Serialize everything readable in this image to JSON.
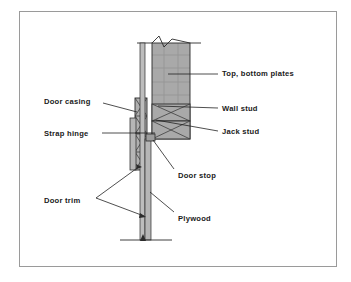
{
  "figure": {
    "border_color": "#9a9a9a",
    "background_color": "#ffffff"
  },
  "palette": {
    "stud_fill": "#a9a9a9",
    "plate_fill": "#a9a9a9",
    "casing_fill": "#b0b0b0",
    "trim_fill": "#b6b6b6",
    "plywood_fill": "#bdbdbd",
    "door_stop_fill": "#9c9c9c",
    "line_color": "#2b2b2b",
    "text_color": "#1a1a1a"
  },
  "labels": {
    "top_bottom_plates": "Top, bottom plates",
    "wall_stud": "Wall stud",
    "jack_stud": "Jack stud",
    "door_casing": "Door casing",
    "strap_hinge": "Strap hinge",
    "door_stop": "Door stop",
    "door_trim": "Door trim",
    "plywood": "Plywood"
  },
  "callouts": [
    {
      "id": "top-bottom-plates",
      "label": "Top, bottom plates",
      "side": "right",
      "text_x": 222,
      "text_y": 76
    },
    {
      "id": "wall-stud",
      "label": "Wall stud",
      "side": "right",
      "text_x": 222,
      "text_y": 110
    },
    {
      "id": "jack-stud",
      "label": "Jack stud",
      "side": "right",
      "text_x": 222,
      "text_y": 133
    },
    {
      "id": "door-casing",
      "label": "Door casing",
      "side": "left",
      "text_x": 44,
      "text_y": 104
    },
    {
      "id": "strap-hinge",
      "label": "Strap hinge",
      "side": "left",
      "text_x": 44,
      "text_y": 134
    },
    {
      "id": "door-stop",
      "label": "Door stop",
      "side": "center",
      "text_x": 178,
      "text_y": 178
    },
    {
      "id": "door-trim",
      "label": "Door trim",
      "side": "left",
      "text_x": 44,
      "text_y": 201
    },
    {
      "id": "plywood",
      "label": "Plywood",
      "side": "center",
      "text_x": 178,
      "text_y": 221
    }
  ],
  "components": [
    {
      "id": "wall-plate",
      "label": "Top, bottom plates",
      "fill": "#a9a9a9"
    },
    {
      "id": "wall-stud",
      "label": "Wall stud",
      "fill": "#a9a9a9"
    },
    {
      "id": "jack-stud",
      "label": "Jack stud",
      "fill": "#a9a9a9"
    },
    {
      "id": "door-casing",
      "label": "Door casing",
      "fill": "#b0b0b0"
    },
    {
      "id": "door-stop",
      "label": "Door stop",
      "fill": "#9c9c9c"
    },
    {
      "id": "door-trim",
      "label": "Door trim",
      "fill": "#b6b6b6"
    },
    {
      "id": "plywood",
      "label": "Plywood",
      "fill": "#bdbdbd"
    }
  ]
}
